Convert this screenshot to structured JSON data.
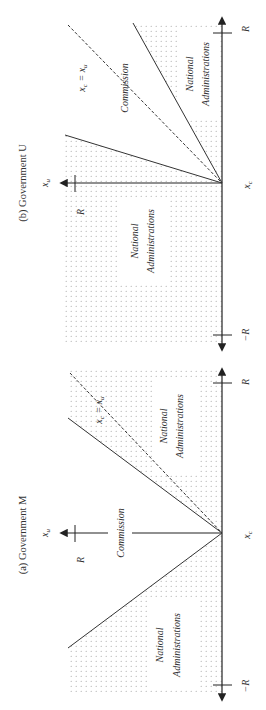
{
  "figure": {
    "panels": [
      {
        "id": "a",
        "title": "(a) Government M",
        "axes": {
          "x_label": "x_c",
          "y_label": "x_u",
          "x_ticks": [
            "−R",
            "R"
          ],
          "y_ticks": [
            "R"
          ]
        },
        "regions": [
          {
            "label_line1": "National",
            "label_line2": "Administrations",
            "shaded": true,
            "position": "lower"
          },
          {
            "label": "Commission",
            "shaded": false,
            "position": "middle"
          },
          {
            "label_line1": "National",
            "label_line2": "Administrations",
            "shaded": true,
            "position": "upper"
          }
        ],
        "reference_line": {
          "label": "x_c = x_u",
          "style": "dashed"
        }
      },
      {
        "id": "b",
        "title": "(b) Government U",
        "axes": {
          "x_label": "x_c",
          "y_label": "x_u",
          "x_ticks": [
            "−R",
            "R"
          ],
          "y_ticks": [
            "R"
          ]
        },
        "regions": [
          {
            "label_line1": "National",
            "label_line2": "Administrations",
            "shaded": true,
            "position": "lower"
          },
          {
            "label": "Commission",
            "shaded": false,
            "position": "middle"
          },
          {
            "label_line1": "National",
            "label_line2": "Administrations",
            "shaded": true,
            "position": "upper"
          }
        ],
        "reference_line": {
          "label": "x_c = x_u",
          "style": "dashed"
        }
      }
    ],
    "text": {
      "title_a": "(a) Government M",
      "title_b": "(b) Government U",
      "national": "National",
      "administrations": "Administrations",
      "commission": "Commission",
      "xc": "x",
      "xc_sub": "c",
      "xu": "x",
      "xu_sub": "u",
      "eq": " = ",
      "R": "R",
      "negR": "−R"
    },
    "colors": {
      "line": "#333333",
      "dots": "#9a9a9a",
      "text": "#333333"
    }
  }
}
